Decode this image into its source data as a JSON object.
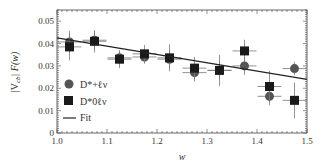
{
  "chart_data": {
    "type": "scatter",
    "title": "",
    "xlabel": "w",
    "ylabel": "|V_cb| F(w)",
    "xlim": [
      1.0,
      1.5
    ],
    "ylim": [
      0,
      0.055
    ],
    "xticks": [
      "1.0",
      "1.1",
      "1.2",
      "1.3",
      "1.4",
      "1.5"
    ],
    "yticks": [
      "0",
      "0.01",
      "0.02",
      "0.03",
      "0.04",
      "0.05"
    ],
    "grid": false,
    "legend_position": "lower-left",
    "series": [
      {
        "name": "D*+ℓν",
        "marker": "circle",
        "color": "#555555",
        "x": [
          1.025,
          1.075,
          1.125,
          1.175,
          1.225,
          1.275,
          1.325,
          1.375,
          1.425,
          1.475
        ],
        "y": [
          0.0407,
          0.0415,
          0.0336,
          0.034,
          0.033,
          0.027,
          0.028,
          0.03,
          0.0164,
          0.0288
        ],
        "yerr": [
          0.005,
          0.004,
          0.003,
          0.003,
          0.004,
          0.004,
          0.004,
          0.004,
          0.004,
          0.003
        ]
      },
      {
        "name": "D*0ℓν",
        "marker": "square",
        "color": "#1a1a1a",
        "x": [
          1.025,
          1.075,
          1.125,
          1.175,
          1.225,
          1.275,
          1.325,
          1.375,
          1.425,
          1.475
        ],
        "y": [
          0.0385,
          0.041,
          0.033,
          0.0354,
          0.0336,
          0.029,
          0.028,
          0.0367,
          0.0208,
          0.0146
        ],
        "yerr": [
          0.006,
          0.005,
          0.004,
          0.004,
          0.006,
          0.005,
          0.007,
          0.005,
          0.007,
          0.008
        ]
      },
      {
        "name": "Fit",
        "marker": "line",
        "color": "#222222",
        "x": [
          1.0,
          1.5
        ],
        "y": [
          0.0425,
          0.024
        ]
      }
    ]
  },
  "axis": {
    "xlabel": "w",
    "ylabel": "|V",
    "ylabel_sub": "cb",
    "ylabel_rest": "| F(w)"
  },
  "legend": {
    "item1": "D*+ℓν",
    "item2": "D*0ℓν",
    "item3": "Fit"
  }
}
